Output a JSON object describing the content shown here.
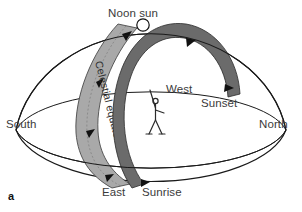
{
  "figure": {
    "panel_label": "a",
    "type": "celestial-sphere-diagram",
    "background_color": "#ffffff",
    "outline_color": "#1a1a1a"
  },
  "labels": {
    "noon_sun": "Noon sun",
    "west": "West",
    "sunset": "Sunset",
    "north": "North",
    "south": "South",
    "east": "East",
    "sunrise": "Sunrise",
    "celestial_equator": "Celestial equator"
  },
  "elements": {
    "sun_marker": {
      "name": "noon-sun-circle",
      "fill": "#ffffff",
      "stroke": "#111111"
    },
    "sun_path_band": {
      "name": "sun-daily-path-band",
      "fill": "#6b6b6b",
      "description": "dark shaded band from sunrise through noon sun to sunset"
    },
    "celestial_equator_band": {
      "name": "celestial-equator-band",
      "fill": "#a9a9a9",
      "description": "light shaded band labeled Celestial equator"
    },
    "observer": {
      "name": "observer-stick-figure",
      "stroke": "#2a2a2a"
    },
    "horizon": {
      "name": "horizon-ellipse",
      "stroke": "#1a1a1a"
    },
    "dome": {
      "name": "sky-dome-outline",
      "stroke": "#1a1a1a"
    }
  }
}
